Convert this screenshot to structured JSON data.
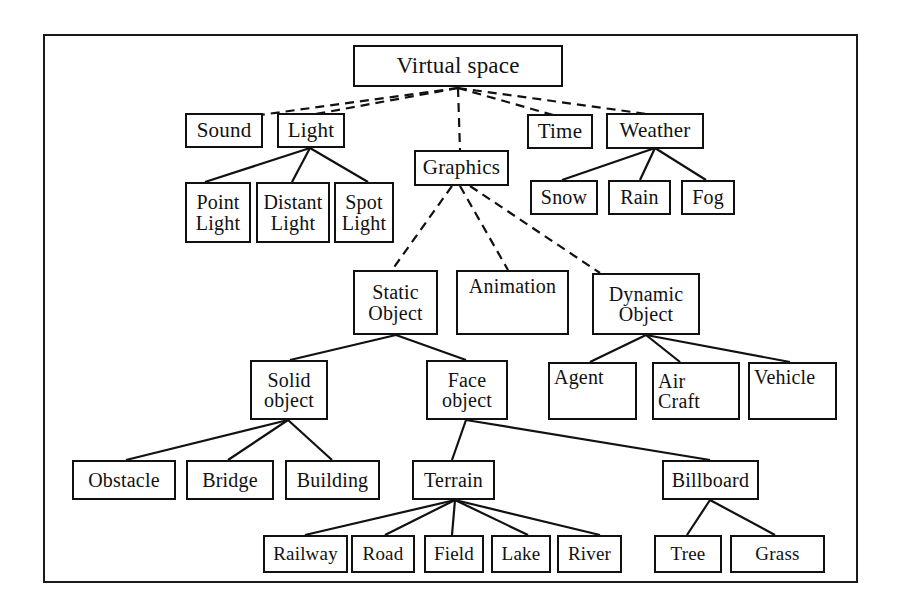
{
  "diagram": {
    "frame": {
      "stroke": "#1a1a1a"
    },
    "nodes": {
      "virtual_space": {
        "label": "Virtual space"
      },
      "sound": {
        "label": "Sound"
      },
      "light": {
        "label": "Light"
      },
      "graphics": {
        "label": "Graphics"
      },
      "time": {
        "label": "Time"
      },
      "weather": {
        "label": "Weather"
      },
      "point_light": {
        "line1": "Point",
        "line2": "Light"
      },
      "distant_light": {
        "line1": "Distant",
        "line2": "Light"
      },
      "spot_light": {
        "line1": "Spot",
        "line2": "Light"
      },
      "snow": {
        "label": "Snow"
      },
      "rain": {
        "label": "Rain"
      },
      "fog": {
        "label": "Fog"
      },
      "static_object": {
        "line1": "Static",
        "line2": "Object"
      },
      "animation": {
        "label": "Animation"
      },
      "dynamic_object": {
        "line1": "Dynamic",
        "line2": "Object"
      },
      "solid_object": {
        "line1": "Solid",
        "line2": "object"
      },
      "face_object": {
        "line1": "Face",
        "line2": "object"
      },
      "agent": {
        "label": "Agent"
      },
      "air_craft": {
        "line1": "Air",
        "line2": "Craft"
      },
      "vehicle": {
        "label": "Vehicle"
      },
      "obstacle": {
        "label": "Obstacle"
      },
      "bridge": {
        "label": "Bridge"
      },
      "building": {
        "label": "Building"
      },
      "terrain": {
        "label": "Terrain"
      },
      "billboard": {
        "label": "Billboard"
      },
      "railway": {
        "label": "Railway"
      },
      "road": {
        "label": "Road"
      },
      "field": {
        "label": "Field"
      },
      "lake": {
        "label": "Lake"
      },
      "river": {
        "label": "River"
      },
      "tree": {
        "label": "Tree"
      },
      "grass": {
        "label": "Grass"
      }
    },
    "edges": {
      "dashed_from_virtual_space": [
        "sound",
        "light",
        "graphics",
        "time",
        "weather"
      ],
      "dashed_from_graphics": [
        "static_object",
        "animation",
        "dynamic_object"
      ],
      "solid_from_light": [
        "point_light",
        "distant_light",
        "spot_light"
      ],
      "solid_from_weather": [
        "snow",
        "rain",
        "fog"
      ],
      "solid_from_static_object": [
        "solid_object",
        "face_object"
      ],
      "solid_from_dynamic_object": [
        "agent",
        "air_craft",
        "vehicle"
      ],
      "solid_from_solid_object": [
        "obstacle",
        "bridge",
        "building"
      ],
      "solid_from_face_object": [
        "terrain",
        "billboard"
      ],
      "solid_from_terrain": [
        "railway",
        "road",
        "field",
        "lake",
        "river"
      ],
      "solid_from_billboard": [
        "tree",
        "grass"
      ]
    }
  }
}
